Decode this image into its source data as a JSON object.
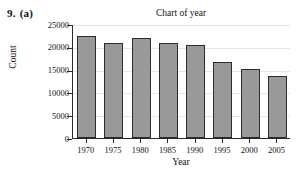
{
  "figure": {
    "problem_number": "9.",
    "problem_part": "(a)"
  },
  "chart_data": {
    "type": "bar",
    "title": "Chart of year",
    "xlabel": "Year",
    "ylabel": "Count",
    "categories": [
      "1970",
      "1975",
      "1980",
      "1985",
      "1990",
      "1995",
      "2000",
      "2005"
    ],
    "values": [
      22300,
      20800,
      22000,
      20900,
      20400,
      16700,
      15200,
      13600
    ],
    "ylim": [
      0,
      25000
    ],
    "yticks": [
      "0",
      "5000",
      "10000",
      "15000",
      "20000",
      "25000"
    ],
    "ytick_values": [
      0,
      5000,
      10000,
      15000,
      20000,
      25000
    ],
    "grid": true,
    "legend": "none",
    "bar_fill_color": "#999999",
    "bar_edge_color": "#2b2b2b",
    "axis_color": "#2a2a2a",
    "gridline_color": "#e6e6e6",
    "background_color": "#ffffff"
  }
}
